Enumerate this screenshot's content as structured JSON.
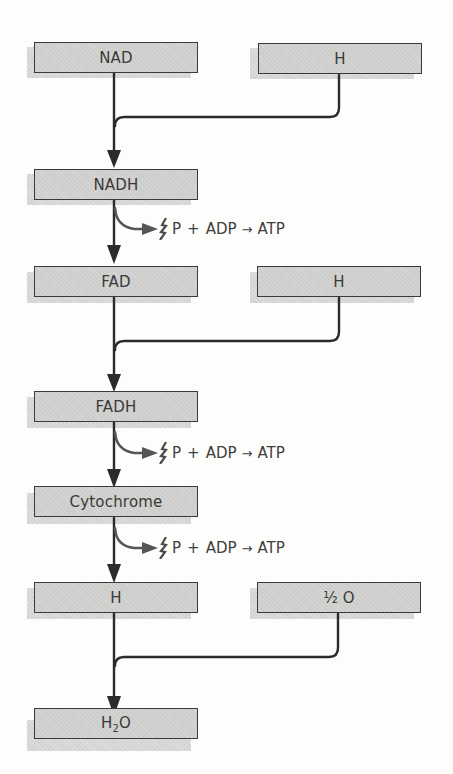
{
  "diagram": {
    "title": "",
    "colors": {
      "box_fill": "#cdcdcb",
      "box_border": "#3a3a3a",
      "line": "#2b2b2b",
      "branch_arrow": "#5a5a5a",
      "text": "#3a3a3a"
    },
    "boxes": {
      "nad": {
        "label": "NAD"
      },
      "h1": {
        "label": "H"
      },
      "nadh": {
        "label": "NADH"
      },
      "fad": {
        "label": "FAD"
      },
      "h2": {
        "label": "H"
      },
      "fadh": {
        "label": "FADH"
      },
      "cytochrome": {
        "label": "Cytochrome"
      },
      "h3": {
        "label": "H"
      },
      "half_o": {
        "label": "½ O"
      },
      "h2o": {
        "prefix": "H",
        "subscript": "2",
        "suffix": "O"
      }
    },
    "reactions": [
      {
        "reactant1": "P",
        "plus": "+",
        "reactant2": "ADP",
        "arrow": "→",
        "product": "ATP"
      },
      {
        "reactant1": "P",
        "plus": "+",
        "reactant2": "ADP",
        "arrow": "→",
        "product": "ATP"
      },
      {
        "reactant1": "P",
        "plus": "+",
        "reactant2": "ADP",
        "arrow": "→",
        "product": "ATP"
      }
    ],
    "edges": [
      {
        "from": "NAD",
        "to": "NADH"
      },
      {
        "from": "H",
        "to": "NADH"
      },
      {
        "from": "NADH",
        "to": "FAD",
        "branch": "P + ADP → ATP"
      },
      {
        "from": "FAD",
        "to": "FADH"
      },
      {
        "from": "H",
        "to": "FADH"
      },
      {
        "from": "FADH",
        "to": "Cytochrome",
        "branch": "P + ADP → ATP"
      },
      {
        "from": "Cytochrome",
        "to": "H",
        "branch": "P + ADP → ATP"
      },
      {
        "from": "H",
        "to": "H2O"
      },
      {
        "from": "½ O",
        "to": "H2O"
      }
    ]
  }
}
